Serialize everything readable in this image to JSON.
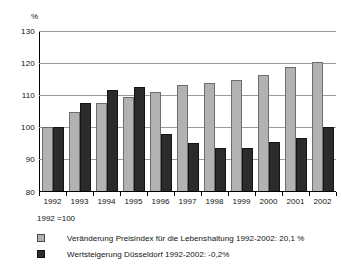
{
  "chart_data": {
    "type": "bar",
    "title": "",
    "subtitle": "",
    "xlabel": "",
    "ylabel": "%",
    "ylim": [
      80,
      130
    ],
    "ytick_step": 10,
    "yticks": [
      130,
      120,
      110,
      100,
      90,
      80
    ],
    "grid": true,
    "legend_position": "bottom-left",
    "base_note": "1992 =100",
    "categories": [
      "1992",
      "1993",
      "1994",
      "1995",
      "1996",
      "1997",
      "1998",
      "1999",
      "2000",
      "2001",
      "2002"
    ],
    "series": [
      {
        "name": "Veränderung Preisindex für die Lebenshaltung 1992-2002: 20,1 %",
        "color": "#b2b2b2",
        "values": [
          100.0,
          104.6,
          107.3,
          109.3,
          110.7,
          112.8,
          113.7,
          114.4,
          116.1,
          118.5,
          120.1
        ]
      },
      {
        "name": "Wertsteigerung Düsseldorf 1992-2002: -0,2%",
        "color": "#2b2b2b",
        "values": [
          100.0,
          107.4,
          111.4,
          112.4,
          97.7,
          94.8,
          93.5,
          93.5,
          95.3,
          96.4,
          100.0
        ]
      }
    ]
  },
  "axis": {
    "unit_label": "%",
    "ytick_labels": [
      "130",
      "120",
      "110",
      "100",
      "90",
      "80"
    ],
    "xtick_labels": [
      "1992",
      "1993",
      "1994",
      "1995",
      "1996",
      "1997",
      "1998",
      "1999",
      "2000",
      "2001",
      "2002"
    ]
  },
  "footnote": {
    "text": "1992 =100"
  },
  "legend": {
    "items": [
      {
        "label": "Veränderung Preisindex für die Lebenshaltung 1992-2002: 20,1 %",
        "swatch": "light-gray-swatch-icon"
      },
      {
        "label": "Wertsteigerung Düsseldorf 1992-2002: -0,2%",
        "swatch": "dark-swatch-icon"
      }
    ]
  },
  "colors": {
    "series_a": "#b2b2b2",
    "series_b": "#2b2b2b",
    "gridline": "#9a9a9a",
    "axis": "#000000",
    "background": "#ffffff"
  }
}
